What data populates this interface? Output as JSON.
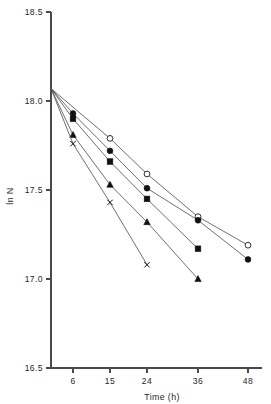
{
  "chart_data": {
    "type": "line",
    "title": "",
    "subtitle": "",
    "xlabel": "Time (h)",
    "ylabel": "ln N",
    "xlim": [
      0,
      52
    ],
    "ylim": [
      16.5,
      18.5
    ],
    "xticks": [
      6,
      15,
      24,
      36,
      48
    ],
    "xtick_labels": [
      "6",
      "15",
      "24",
      "36",
      "48"
    ],
    "yticks": [
      16.5,
      17.0,
      17.5,
      18.0,
      18.5
    ],
    "ytick_labels": [
      "16.5",
      "17.0",
      "17.5",
      "18.0",
      "18.5"
    ],
    "grid": false,
    "legend": "none",
    "origin_point": {
      "x": 0,
      "y": 18.07
    },
    "series": [
      {
        "name": "series-open-circle",
        "marker": "open-circle",
        "x": [
          0,
          15,
          24,
          36,
          48
        ],
        "y": [
          18.07,
          17.79,
          17.59,
          17.35,
          17.19
        ]
      },
      {
        "name": "series-filled-circle",
        "marker": "filled-circle",
        "x": [
          0,
          6,
          15,
          24,
          36,
          48
        ],
        "y": [
          18.07,
          17.93,
          17.72,
          17.51,
          17.33,
          17.11
        ]
      },
      {
        "name": "series-filled-square",
        "marker": "filled-square",
        "x": [
          0,
          6,
          15,
          24,
          36
        ],
        "y": [
          18.07,
          17.9,
          17.66,
          17.45,
          17.17
        ]
      },
      {
        "name": "series-filled-triangle",
        "marker": "filled-triangle",
        "x": [
          0,
          6,
          15,
          24,
          36
        ],
        "y": [
          18.07,
          17.81,
          17.53,
          17.32,
          17.0
        ]
      },
      {
        "name": "series-cross",
        "marker": "cross",
        "x": [
          0,
          6,
          15,
          24
        ],
        "y": [
          18.07,
          17.76,
          17.43,
          17.08
        ]
      }
    ]
  },
  "axes": {
    "x_title": "Time (h)",
    "y_title": "ln N"
  }
}
